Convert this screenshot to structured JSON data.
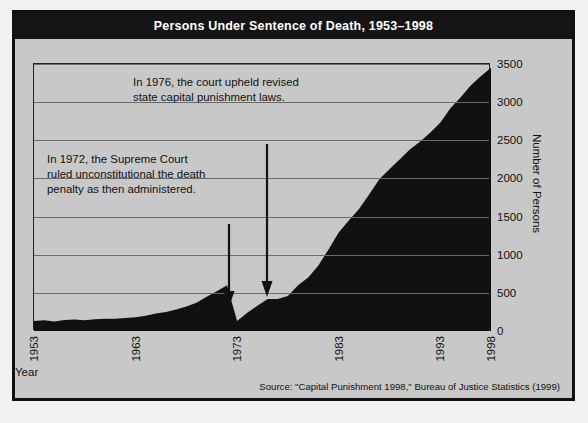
{
  "figure": {
    "title": "Persons Under Sentence of Death, 1953–1998",
    "source": "Source: \"Capital Punishment 1998,\" Bureau of Justice Statistics (1999)",
    "colors": {
      "title_bar_bg": "#151515",
      "panel_bg": "#c8c8c8",
      "area_fill": "#111111",
      "grid": "#6a6a6a",
      "text": "#111111",
      "title_text": "#ffffff"
    }
  },
  "annotations": [
    {
      "id": "annot-1972",
      "text": "In 1972, the Supreme Court\nruled unconstitutional the death\npenalty as then administered.",
      "arrow_year": 1972
    },
    {
      "id": "annot-1976",
      "text": "In 1976, the court upheld revised\nstate capital punishment laws.",
      "arrow_year": 1976
    }
  ],
  "chart_data": {
    "type": "area",
    "title": "Persons Under Sentence of Death, 1953–1998",
    "xlabel": "Year",
    "ylabel": "Number of Persons",
    "xlim": [
      1953,
      1998
    ],
    "ylim": [
      0,
      3500
    ],
    "ytick_labels": [
      "0",
      "500",
      "1000",
      "1500",
      "2000",
      "2500",
      "3000",
      "3500"
    ],
    "yticks": [
      0,
      500,
      1000,
      1500,
      2000,
      2500,
      3000,
      3500
    ],
    "xtick_labels": [
      "1953",
      "1963",
      "1973",
      "1983",
      "1993",
      "1998"
    ],
    "xticks": [
      1953,
      1963,
      1973,
      1983,
      1993,
      1998
    ],
    "grid": true,
    "legend": "none",
    "x": [
      1953,
      1954,
      1955,
      1956,
      1957,
      1958,
      1959,
      1960,
      1961,
      1962,
      1963,
      1964,
      1965,
      1966,
      1967,
      1968,
      1969,
      1970,
      1971,
      1972,
      1973,
      1974,
      1975,
      1976,
      1977,
      1978,
      1979,
      1980,
      1981,
      1982,
      1983,
      1984,
      1985,
      1986,
      1987,
      1988,
      1989,
      1990,
      1991,
      1992,
      1993,
      1994,
      1995,
      1996,
      1997,
      1998
    ],
    "values": [
      130,
      140,
      125,
      145,
      150,
      140,
      155,
      160,
      160,
      170,
      180,
      200,
      230,
      250,
      280,
      320,
      370,
      450,
      520,
      600,
      130,
      240,
      330,
      420,
      420,
      460,
      600,
      700,
      860,
      1070,
      1290,
      1450,
      1600,
      1790,
      1990,
      2120,
      2250,
      2380,
      2480,
      2600,
      2730,
      2920,
      3060,
      3220,
      3340,
      3450
    ],
    "series": [
      {
        "name": "Persons under sentence of death",
        "values": [
          130,
          140,
          125,
          145,
          150,
          140,
          155,
          160,
          160,
          170,
          180,
          200,
          230,
          250,
          280,
          320,
          370,
          450,
          520,
          600,
          130,
          240,
          330,
          420,
          420,
          460,
          600,
          700,
          860,
          1070,
          1290,
          1450,
          1600,
          1790,
          1990,
          2120,
          2250,
          2380,
          2480,
          2600,
          2730,
          2920,
          3060,
          3220,
          3340,
          3450
        ]
      }
    ]
  }
}
